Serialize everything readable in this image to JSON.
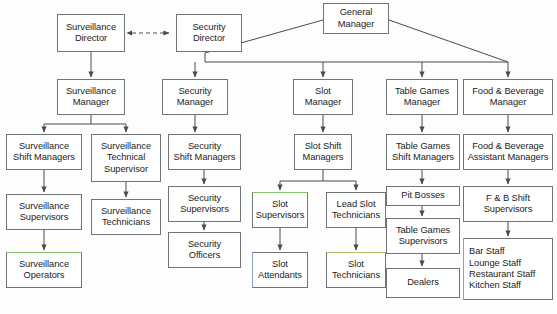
{
  "chart_data": {
    "type": "diagram",
    "diagram_kind": "organizational-chart",
    "nodes": [
      {
        "id": "general-manager",
        "lines": [
          "General",
          "Manager"
        ],
        "x": 323,
        "y": 3,
        "w": 66,
        "h": 31
      },
      {
        "id": "surveillance-director",
        "lines": [
          "Surveillance",
          "Director"
        ],
        "x": 57,
        "y": 14,
        "w": 68,
        "h": 38
      },
      {
        "id": "security-director",
        "lines": [
          "Security",
          "Director"
        ],
        "x": 176,
        "y": 14,
        "w": 66,
        "h": 38
      },
      {
        "id": "surveillance-manager",
        "lines": [
          "Surveillance",
          "Manager"
        ],
        "x": 57,
        "y": 79,
        "w": 68,
        "h": 36
      },
      {
        "id": "security-manager",
        "lines": [
          "Security",
          "Manager"
        ],
        "x": 162,
        "y": 79,
        "w": 66,
        "h": 36
      },
      {
        "id": "slot-manager",
        "lines": [
          "Slot",
          "Manager"
        ],
        "x": 293,
        "y": 79,
        "w": 60,
        "h": 36
      },
      {
        "id": "table-games-manager",
        "lines": [
          "Table Games",
          "Manager"
        ],
        "x": 386,
        "y": 79,
        "w": 72,
        "h": 36
      },
      {
        "id": "food-beverage-manager",
        "lines": [
          "Food & Beverage",
          "Manager"
        ],
        "x": 463,
        "y": 79,
        "w": 90,
        "h": 36
      },
      {
        "id": "surveillance-shift-managers",
        "lines": [
          "Surveillance",
          "Shift Managers"
        ],
        "x": 6,
        "y": 134,
        "w": 76,
        "h": 36
      },
      {
        "id": "surveillance-technical-supervisor",
        "lines": [
          "Surveillance",
          "Technical",
          "Supervisor"
        ],
        "x": 91,
        "y": 134,
        "w": 70,
        "h": 48
      },
      {
        "id": "security-shift-managers",
        "lines": [
          "Security",
          "Shift Managers"
        ],
        "x": 168,
        "y": 134,
        "w": 73,
        "h": 36
      },
      {
        "id": "slot-shift-managers",
        "lines": [
          "Slot Shift",
          "Managers"
        ],
        "x": 294,
        "y": 134,
        "w": 58,
        "h": 36
      },
      {
        "id": "table-games-shift-managers",
        "lines": [
          "Table Games",
          "Shift Managers"
        ],
        "x": 386,
        "y": 134,
        "w": 74,
        "h": 36
      },
      {
        "id": "food-beverage-assistant-managers",
        "lines": [
          "Food & Beverage",
          "Assistant Managers"
        ],
        "x": 463,
        "y": 134,
        "w": 90,
        "h": 36
      },
      {
        "id": "surveillance-supervisors",
        "lines": [
          "Surveillance",
          "Supervisors"
        ],
        "x": 6,
        "y": 194,
        "w": 76,
        "h": 36
      },
      {
        "id": "surveillance-technicians",
        "lines": [
          "Surveillance",
          "Technicians"
        ],
        "x": 91,
        "y": 199,
        "w": 70,
        "h": 36
      },
      {
        "id": "security-supervisors",
        "lines": [
          "Security",
          "Supervisors"
        ],
        "x": 168,
        "y": 186,
        "w": 73,
        "h": 36
      },
      {
        "id": "pit-bosses",
        "lines": [
          "Pit Bosses"
        ],
        "x": 386,
        "y": 186,
        "w": 74,
        "h": 20
      },
      {
        "id": "fb-shift-supervisors",
        "lines": [
          "F & B Shift",
          "Supervisors"
        ],
        "x": 463,
        "y": 186,
        "w": 90,
        "h": 36
      },
      {
        "id": "slot-supervisors",
        "lines": [
          "Slot",
          "Supervisors"
        ],
        "x": 252,
        "y": 192,
        "w": 56,
        "h": 36
      },
      {
        "id": "lead-slot-technicians",
        "lines": [
          "Lead Slot",
          "Technicians"
        ],
        "x": 326,
        "y": 192,
        "w": 60,
        "h": 36
      },
      {
        "id": "surveillance-operators",
        "lines": [
          "Surveillance",
          "Operators"
        ],
        "x": 6,
        "y": 252,
        "w": 76,
        "h": 36
      },
      {
        "id": "security-officers",
        "lines": [
          "Security",
          "Officers"
        ],
        "x": 168,
        "y": 232,
        "w": 73,
        "h": 36
      },
      {
        "id": "table-games-supervisors",
        "lines": [
          "Table Games",
          "Supervisors"
        ],
        "x": 386,
        "y": 218,
        "w": 74,
        "h": 36
      },
      {
        "id": "slot-attendants",
        "lines": [
          "Slot",
          "Attendants"
        ],
        "x": 252,
        "y": 252,
        "w": 56,
        "h": 36
      },
      {
        "id": "slot-technicians",
        "lines": [
          "Slot",
          "Technicians"
        ],
        "x": 326,
        "y": 252,
        "w": 60,
        "h": 36
      },
      {
        "id": "dealers",
        "lines": [
          "Dealers"
        ],
        "x": 386,
        "y": 268,
        "w": 74,
        "h": 30
      },
      {
        "id": "fb-staff",
        "lines": [
          "Bar Staff",
          "Lounge Staff",
          "Restaurant Staff",
          "Kitchen Staff"
        ],
        "x": 463,
        "y": 238,
        "w": 90,
        "h": 62
      }
    ],
    "edges": [
      {
        "from": "surveillance-director",
        "to": "security-director",
        "style": "dashed",
        "direction": "both"
      },
      {
        "from": "general-manager",
        "to": "security-director",
        "style": "solid"
      },
      {
        "from": "general-manager",
        "to": "security-manager",
        "style": "solid"
      },
      {
        "from": "general-manager",
        "to": "slot-manager",
        "style": "solid"
      },
      {
        "from": "general-manager",
        "to": "table-games-manager",
        "style": "solid"
      },
      {
        "from": "general-manager",
        "to": "food-beverage-manager",
        "style": "solid"
      },
      {
        "from": "surveillance-director",
        "to": "surveillance-manager",
        "style": "solid"
      },
      {
        "from": "surveillance-manager",
        "to": "surveillance-shift-managers",
        "style": "solid"
      },
      {
        "from": "surveillance-manager",
        "to": "surveillance-technical-supervisor",
        "style": "solid"
      },
      {
        "from": "surveillance-shift-managers",
        "to": "surveillance-supervisors",
        "style": "solid"
      },
      {
        "from": "surveillance-supervisors",
        "to": "surveillance-operators",
        "style": "solid"
      },
      {
        "from": "surveillance-technical-supervisor",
        "to": "surveillance-technicians",
        "style": "solid"
      },
      {
        "from": "security-manager",
        "to": "security-shift-managers",
        "style": "solid"
      },
      {
        "from": "security-shift-managers",
        "to": "security-supervisors",
        "style": "solid"
      },
      {
        "from": "security-supervisors",
        "to": "security-officers",
        "style": "solid"
      },
      {
        "from": "slot-manager",
        "to": "slot-shift-managers",
        "style": "solid"
      },
      {
        "from": "slot-shift-managers",
        "to": "slot-supervisors",
        "style": "solid"
      },
      {
        "from": "slot-shift-managers",
        "to": "lead-slot-technicians",
        "style": "solid"
      },
      {
        "from": "slot-supervisors",
        "to": "slot-attendants",
        "style": "solid"
      },
      {
        "from": "lead-slot-technicians",
        "to": "slot-technicians",
        "style": "solid"
      },
      {
        "from": "table-games-manager",
        "to": "table-games-shift-managers",
        "style": "solid"
      },
      {
        "from": "table-games-shift-managers",
        "to": "pit-bosses",
        "style": "solid"
      },
      {
        "from": "pit-bosses",
        "to": "table-games-supervisors",
        "style": "solid"
      },
      {
        "from": "table-games-supervisors",
        "to": "dealers",
        "style": "solid"
      },
      {
        "from": "food-beverage-manager",
        "to": "food-beverage-assistant-managers",
        "style": "solid"
      },
      {
        "from": "food-beverage-assistant-managers",
        "to": "fb-shift-supervisors",
        "style": "solid"
      },
      {
        "from": "fb-shift-supervisors",
        "to": "fb-staff",
        "style": "solid"
      }
    ],
    "colors": {
      "box_border": "#6f7479",
      "box_fill": "#ffffff",
      "edge": "#4a4a4a",
      "background": "#fdfdfd",
      "text": "#1c1c1c"
    }
  }
}
